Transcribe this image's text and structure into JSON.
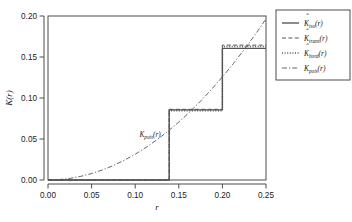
{
  "chart_data": {
    "type": "line",
    "title": "",
    "xlabel": "r",
    "ylabel": "K(r)",
    "xlim": [
      0.0,
      0.25
    ],
    "ylim": [
      0.0,
      0.2
    ],
    "xticks": [
      "0.00",
      "0.05",
      "0.10",
      "0.15",
      "0.20",
      "0.25"
    ],
    "xtick_values": [
      0.0,
      0.05,
      0.1,
      0.15,
      0.2,
      0.25
    ],
    "yticks": [
      "0.00",
      "0.05",
      "0.10",
      "0.15",
      "0.20"
    ],
    "ytick_values": [
      0.0,
      0.05,
      0.1,
      0.15,
      0.2
    ],
    "grid": false,
    "legend_position": "right-outside",
    "annotations": [
      {
        "text": "K",
        "sub": "pois",
        "suffix": "(r)",
        "x": 0.105,
        "y": 0.052
      }
    ],
    "series": [
      {
        "name": "K_iso",
        "label_base": "K",
        "label_sub": "iso",
        "label_suffix": "(r)",
        "hat": true,
        "style": "solid",
        "type": "step",
        "step_x": [
          0.0,
          0.139,
          0.139,
          0.2,
          0.2,
          0.25
        ],
        "step_y": [
          0.0,
          0.0,
          0.0855,
          0.0855,
          0.1605,
          0.1605
        ]
      },
      {
        "name": "K_trans",
        "label_base": "K",
        "label_sub": "trans",
        "label_suffix": "(r)",
        "hat": true,
        "style": "dashed",
        "type": "step",
        "step_x": [
          0.0,
          0.139,
          0.139,
          0.2,
          0.2,
          0.25
        ],
        "step_y": [
          0.0,
          0.0,
          0.0862,
          0.0862,
          0.1645,
          0.1645
        ]
      },
      {
        "name": "K_bord",
        "label_base": "K",
        "label_sub": "bord",
        "label_suffix": "(r)",
        "hat": true,
        "style": "dotted",
        "type": "step",
        "step_x": [
          0.0,
          0.139,
          0.139,
          0.2,
          0.2,
          0.25
        ],
        "step_y": [
          0.0,
          0.0,
          0.0845,
          0.0845,
          0.1628,
          0.1628
        ]
      },
      {
        "name": "K_pois",
        "label_base": "K",
        "label_sub": "pois",
        "label_suffix": "(r)",
        "hat": false,
        "style": "dashdot",
        "type": "smooth",
        "formula": "pi*r^2",
        "x": [
          0.0,
          0.0125,
          0.025,
          0.0375,
          0.05,
          0.0625,
          0.075,
          0.0875,
          0.1,
          0.1125,
          0.125,
          0.1375,
          0.15,
          0.1625,
          0.175,
          0.1875,
          0.2,
          0.2125,
          0.225,
          0.2375,
          0.25
        ],
        "y": [
          0.0,
          0.00049,
          0.00196,
          0.00442,
          0.00785,
          0.01227,
          0.01767,
          0.02405,
          0.03142,
          0.03976,
          0.04909,
          0.0594,
          0.07069,
          0.08296,
          0.09621,
          0.11045,
          0.12566,
          0.14186,
          0.15904,
          0.17721,
          0.19635
        ]
      }
    ]
  }
}
